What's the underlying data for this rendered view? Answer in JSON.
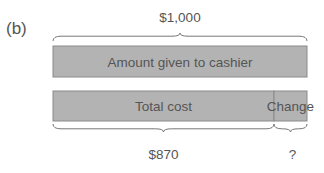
{
  "figure": {
    "panel_label": "(b)",
    "total_amount_label": "$1,000",
    "top_bar": {
      "label": "Amount given to cashier"
    },
    "bottom_bar": {
      "segments": [
        {
          "label": "Total cost",
          "value": 870
        },
        {
          "label": "Change",
          "value": 130
        }
      ]
    },
    "total_cost_label": "$870",
    "change_label": "?",
    "total_value": 1000
  },
  "colors": {
    "bar_fill": "#b3b3b3",
    "bar_stroke": "#8a8a8a",
    "brace": "#777777",
    "text": "#555555"
  }
}
